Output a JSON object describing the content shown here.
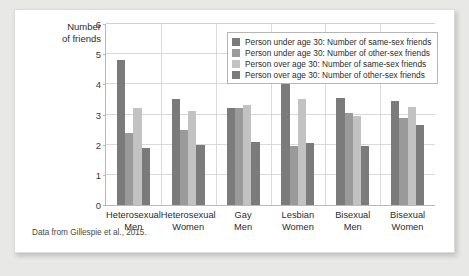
{
  "chart_data": {
    "type": "bar",
    "title": "",
    "xlabel": "",
    "ylabel": "Number of friends",
    "ylim": [
      0,
      6
    ],
    "yticks": [
      0,
      1,
      2,
      3,
      4,
      5,
      6
    ],
    "grid": true,
    "legend_position": "top-right",
    "categories": [
      "Heterosexual Men",
      "Heterosexual Women",
      "Gay Men",
      "Lesbian Women",
      "Bisexual Men",
      "Bisexual Women"
    ],
    "category_lines": [
      [
        "Heterosexual",
        "Men"
      ],
      [
        "Heterosexual",
        "Women"
      ],
      [
        "Gay",
        "Men"
      ],
      [
        "Lesbian",
        "Women"
      ],
      [
        "Bisexual",
        "Men"
      ],
      [
        "Bisexual",
        "Women"
      ]
    ],
    "series": [
      {
        "name": "Person under age 30: Number of same-sex friends",
        "color": "#7b7b7b",
        "values": [
          4.8,
          3.5,
          3.2,
          4.05,
          3.55,
          3.45
        ]
      },
      {
        "name": "Person under age 30: Number of other-sex friends",
        "color": "#9a9a9a",
        "values": [
          2.4,
          2.5,
          3.22,
          1.95,
          3.05,
          2.9
        ]
      },
      {
        "name": "Person over age 30: Number of same-sex friends",
        "color": "#c2c2c2",
        "values": [
          3.2,
          3.1,
          3.3,
          3.5,
          2.95,
          3.25
        ]
      },
      {
        "name": "Person over age 30: Number of other-sex friends",
        "color": "#7b7b7b",
        "values": [
          1.9,
          2.0,
          2.1,
          2.05,
          1.95,
          2.65
        ]
      }
    ],
    "caption": "Data from Gillespie et al., 2015."
  },
  "axis": {
    "ylabel_line1": "Number",
    "ylabel_line2": "of friends"
  }
}
